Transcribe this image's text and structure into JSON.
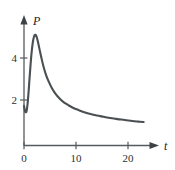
{
  "chart_data": {
    "type": "line",
    "title": "",
    "subtitle": "",
    "xlabel": "t",
    "ylabel": "P",
    "xlim": [
      0,
      24.5
    ],
    "ylim": [
      0,
      6.2
    ],
    "grid": false,
    "legend": null,
    "xticks": [
      0,
      10,
      20
    ],
    "xticklabels": [
      "0",
      "10",
      "20"
    ],
    "yticks": [
      2,
      4
    ],
    "yticklabels": [
      "2",
      "4"
    ],
    "annotations": [],
    "series": [
      {
        "name": "P",
        "color": "#4a4f52",
        "x": [
          0.0,
          0.15,
          0.3,
          0.5,
          0.7,
          0.9,
          1.1,
          1.3,
          1.5,
          1.7,
          1.9,
          2.1,
          2.3,
          2.5,
          2.7,
          3.0,
          3.4,
          3.8,
          4.3,
          4.8,
          5.4,
          6.0,
          6.8,
          7.6,
          8.5,
          9.5,
          10.5,
          11.6,
          12.8,
          14.0,
          15.3,
          16.6,
          18.0,
          19.4,
          20.8,
          22.0,
          23.0
        ],
        "y": [
          1.72,
          1.52,
          1.42,
          1.48,
          1.85,
          2.45,
          3.15,
          3.8,
          4.35,
          4.75,
          5.0,
          5.1,
          5.08,
          4.95,
          4.75,
          4.4,
          3.95,
          3.55,
          3.15,
          2.85,
          2.55,
          2.32,
          2.08,
          1.9,
          1.76,
          1.62,
          1.52,
          1.42,
          1.33,
          1.26,
          1.2,
          1.14,
          1.09,
          1.05,
          1.0,
          0.97,
          0.95
        ]
      }
    ],
    "peak": {
      "t": 2.2,
      "P": 5.1
    },
    "start": {
      "t": 0,
      "P": 1.72
    }
  },
  "axes": {
    "y_axis_name": "vertical-axis",
    "x_axis_name": "horizontal-axis",
    "y_label": "P",
    "x_label": "t"
  }
}
